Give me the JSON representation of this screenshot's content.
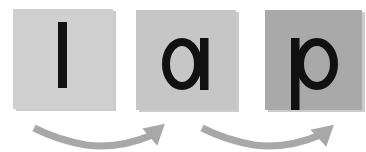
{
  "diagram": {
    "cards": [
      {
        "letter": "l",
        "color": "#cfcfcf"
      },
      {
        "letter": "a",
        "color": "#c6c6c6"
      },
      {
        "letter": "p",
        "color": "#a9a9a9"
      }
    ],
    "arrows": [
      {
        "from": "l",
        "to": "a",
        "color": "#a8a8a8"
      },
      {
        "from": "a",
        "to": "p",
        "color": "#a8a8a8"
      }
    ],
    "letter_color": "#111111",
    "word": "lap"
  }
}
